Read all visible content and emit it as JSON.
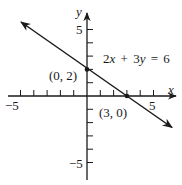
{
  "figure": {
    "type": "linear-equation-graph",
    "equation_label": {
      "a": "2",
      "x": "x",
      "plus": "+",
      "b": "3",
      "y": "y",
      "eq": "=",
      "c": "6",
      "full": "2x + 3y = 6"
    },
    "axes": {
      "x_label": "x",
      "y_label": "y",
      "x_tick_labels": {
        "neg": "−5",
        "pos": "5"
      },
      "y_tick_labels": {
        "neg": "−5",
        "pos": "5"
      },
      "x_range": [
        -5,
        5
      ],
      "y_range": [
        -5,
        5
      ],
      "tick_step": 1
    },
    "points": [
      {
        "label": "(0, 2)",
        "x": 0,
        "y": 2
      },
      {
        "label": "(3, 0)",
        "x": 3,
        "y": 0
      }
    ],
    "line": {
      "slope": -0.6667,
      "y_intercept": 2,
      "x_intercept": 3
    },
    "colors": {
      "ink": "#1a1a1a",
      "background": "#ffffff"
    }
  }
}
